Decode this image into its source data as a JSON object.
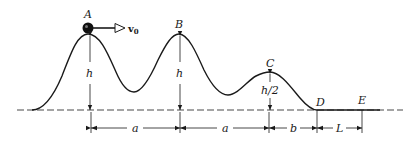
{
  "diagram": {
    "type": "track-profile",
    "points": {
      "A": {
        "label": "A",
        "x": 88,
        "y": 34
      },
      "B": {
        "label": "B",
        "x": 179,
        "y": 34
      },
      "C": {
        "label": "C",
        "x": 270,
        "y": 72
      },
      "D": {
        "label": "D",
        "x": 317,
        "y": 110
      },
      "E": {
        "label": "E",
        "x": 362,
        "y": 110
      }
    },
    "velocity": {
      "label": "v",
      "subscript": "0"
    },
    "heights": {
      "A": "h",
      "B": "h",
      "C": "h/2"
    },
    "dimensions": [
      {
        "label": "a",
        "from": "A",
        "to": "B"
      },
      {
        "label": "a",
        "from": "B",
        "to": "C"
      },
      {
        "label": "b",
        "from": "C",
        "to": "D"
      },
      {
        "label": "L",
        "from": "D",
        "to": "E"
      }
    ]
  }
}
